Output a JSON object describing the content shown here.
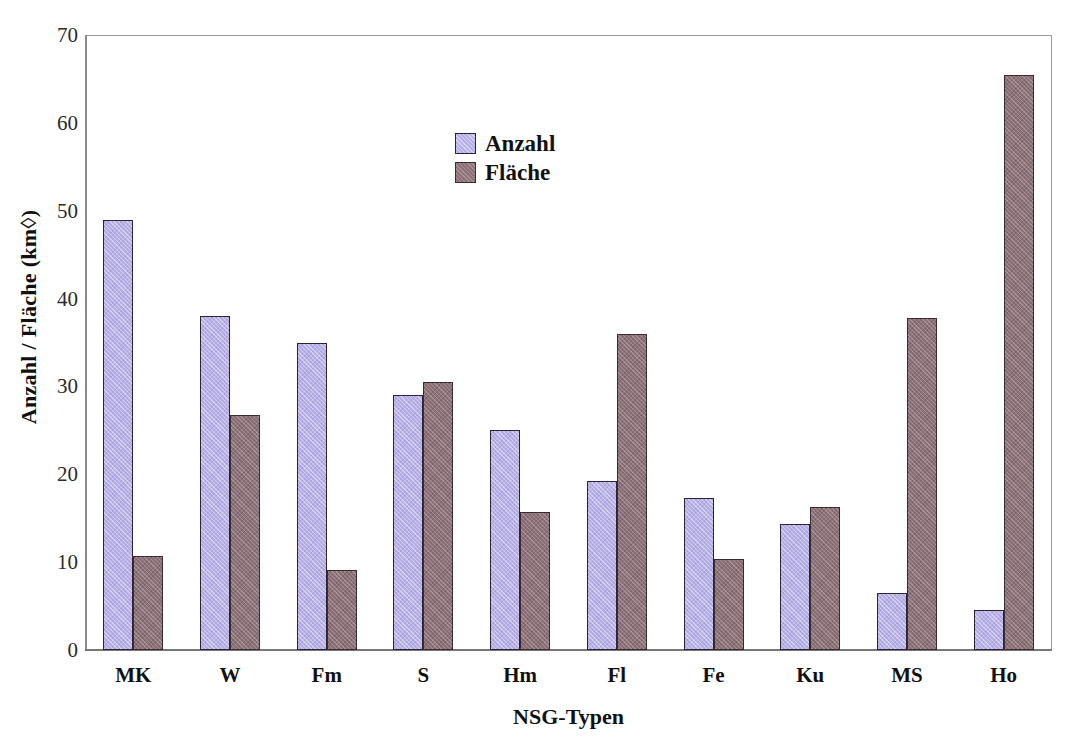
{
  "chart_data": {
    "type": "bar",
    "title": "",
    "subtitle": "",
    "xlabel": "NSG-Typen",
    "ylabel": "Anzahl / Fläche (km◊)",
    "categories": [
      "MK",
      "W",
      "Fm",
      "S",
      "Hm",
      "Fl",
      "Fe",
      "Ku",
      "MS",
      "Ho"
    ],
    "series": [
      {
        "name": "Anzahl",
        "color": "#b7b1e8",
        "values": [
          49.0,
          38.0,
          35.0,
          29.0,
          25.0,
          19.2,
          17.3,
          14.4,
          6.5,
          4.6
        ]
      },
      {
        "name": "Fläche",
        "color": "#8d7379",
        "values": [
          10.7,
          26.8,
          9.1,
          30.5,
          15.7,
          36.0,
          10.4,
          16.3,
          37.8,
          65.5
        ]
      }
    ],
    "ylim": [
      0,
      70
    ],
    "y_ticks": [
      0,
      10,
      20,
      30,
      40,
      50,
      60,
      70
    ],
    "y_tick_labels": [
      "0",
      "10",
      "20",
      "30",
      "40",
      "50",
      "60",
      "70"
    ],
    "grid": false,
    "legend_position": "inside-top-center",
    "axis_frame": true
  },
  "legend": {
    "entries": [
      {
        "label": "Anzahl"
      },
      {
        "label": "Fläche"
      }
    ]
  }
}
